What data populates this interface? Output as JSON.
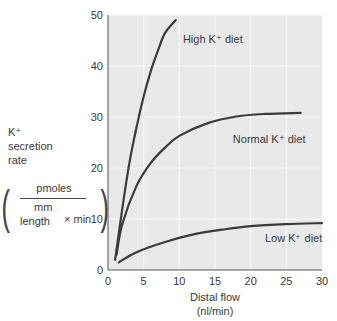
{
  "chart_data": {
    "type": "line",
    "title": "",
    "xlabel": "Distal flow (nl/min)",
    "xlabel_lines": [
      "Distal flow",
      "(nl/min)"
    ],
    "ylabel": "K+ secretion rate (pmoles / mm length × min)",
    "ylabel_lines": [
      "K⁺",
      "secretion",
      "rate"
    ],
    "ylabel_units": {
      "numerator": "pmoles",
      "denominator_top": "mm",
      "denominator_bottom": "length",
      "times": "× min"
    },
    "xlim": [
      0,
      30
    ],
    "ylim": [
      0,
      50
    ],
    "xticks": [
      0,
      5,
      10,
      15,
      20,
      25,
      30
    ],
    "yticks": [
      0,
      10,
      20,
      30,
      40,
      50
    ],
    "grid": true,
    "legend": "inline labels",
    "series": [
      {
        "name": "High K⁺ diet",
        "label_pos": [
          10.5,
          44.5
        ],
        "x": [
          1,
          2,
          3,
          4,
          5,
          6,
          7,
          8,
          9.5
        ],
        "y": [
          2,
          12,
          21,
          28,
          34,
          39,
          43,
          46.5,
          49
        ]
      },
      {
        "name": "Normal K⁺ diet",
        "label_pos": [
          17.5,
          25
        ],
        "x": [
          1.2,
          2,
          4,
          6,
          8,
          10,
          14,
          18,
          22,
          27
        ],
        "y": [
          3,
          9,
          16.5,
          21,
          24,
          26.3,
          28.8,
          30.1,
          30.6,
          30.8
        ]
      },
      {
        "name": "Low K⁺ diet",
        "label_pos": [
          22,
          5.5
        ],
        "x": [
          1.5,
          4,
          8,
          12,
          16,
          20,
          25,
          30
        ],
        "y": [
          1.5,
          3.5,
          5.5,
          7,
          7.9,
          8.6,
          9,
          9.2
        ]
      }
    ]
  },
  "colors": {
    "plot_bg": "#e9e9e9",
    "grid": "#f7f7f7",
    "line": "#3a3a3a",
    "axis": "#555555",
    "text": "#3a3a3a"
  }
}
